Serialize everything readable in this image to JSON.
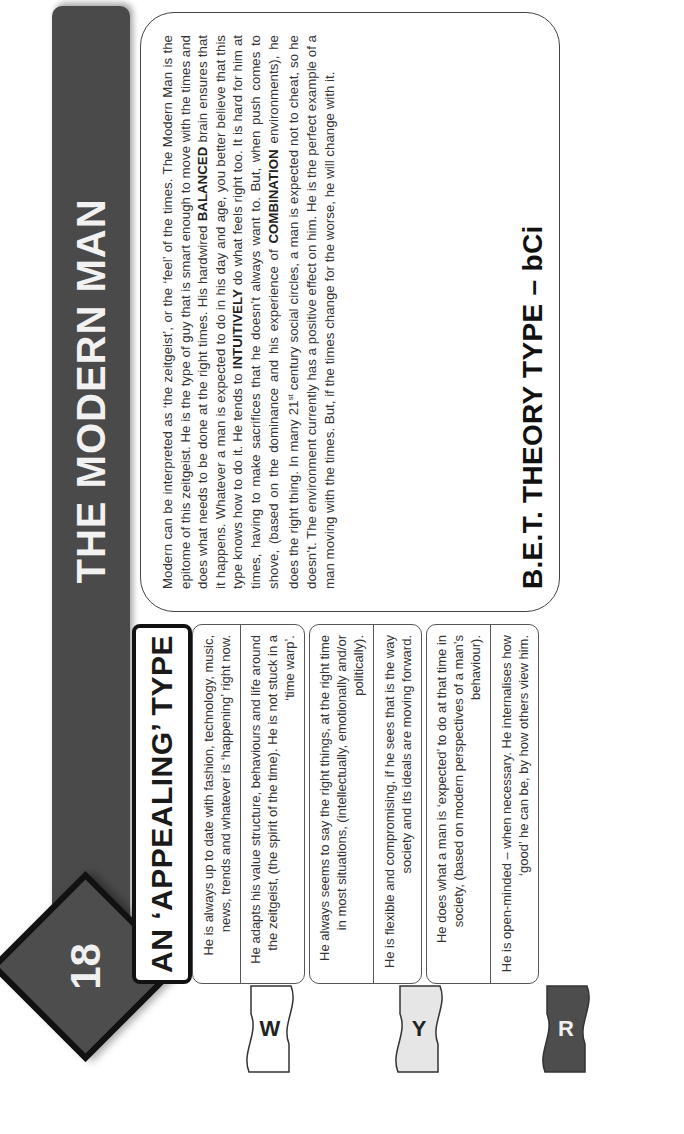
{
  "header": {
    "number": "18",
    "title": "THE MODERN MAN"
  },
  "section": {
    "title": "AN ‘APPEALING’ TYPE"
  },
  "traits": [
    "He is always up to date with fashion, technology, music, news, trends and whatever is ‘happening’ right now.",
    "He adapts his value structure, behaviours and life around the zeitgeist, (the spirit of the time). He is not stuck in a ‘time warp’.",
    "He always seems to say the right things, at the right time in most situations, (intellectually, emotionally and/or politically).",
    "He is flexible and compromising, if he sees that is the way society and its ideals are moving forward.",
    "He does what a man is ‘expected’ to do at that time in society, (based on modern perspectives of a man’s behaviour).",
    "He is open-minded – when necessary. He internalises how ‘good’ he can be, by how others view him."
  ],
  "tabs": [
    {
      "label": "W",
      "color": "#ffffff"
    },
    {
      "label": "Y",
      "color": "#e6e6e6"
    },
    {
      "label": "R",
      "color": "#4d4d4d"
    }
  ],
  "description": {
    "p1": "Modern can be interpreted as ‘the zeitgeist’, or the ‘feel’ of the times. The Modern Man is the epitome of this zeitgeist. He is the type of guy that is smart enough to move with the times and does what needs to be done at the right times. His hardwired ",
    "balanced": "BALANCED",
    "p2": " brain ensures that it happens. Whatever a man is expected to do in his day and age, you better believe that this type knows how to do it. He tends to ",
    "intuitively": "INTUITIVELY",
    "p3": " do what feels right too. It is hard for him at times, having to make sacrifices that he doesn’t always want to. But, when push comes to shove, (based on the dominance and his experience of ",
    "combination": "COMBINATION",
    "p4": " environments), he does the right thing. In many 21",
    "sup": "st",
    "p5": " century social circles, a man is expected not to cheat, so he doesn’t. The environment currently has a positive effect on him. He is the perfect example of a man moving with the times. But, if the times change for the worse, he will change with it.",
    "footer": "B.E.T. THEORY TYPE – bCi"
  }
}
